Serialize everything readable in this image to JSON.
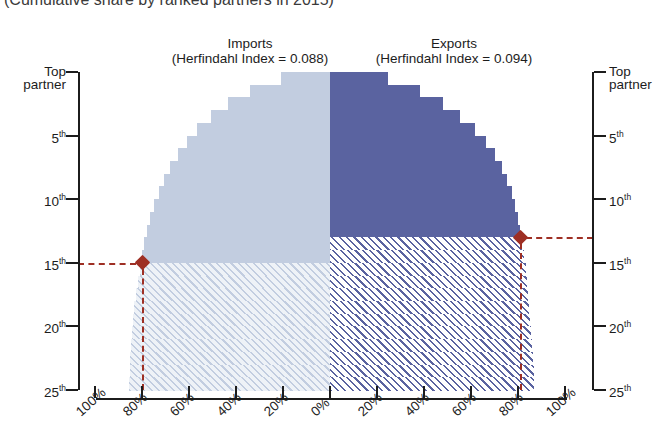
{
  "title": "(Cumulative share by ranked partners in 2015)",
  "panels": {
    "left": {
      "name": "Imports",
      "sub": "(Herfindahl Index = 0.088)"
    },
    "right": {
      "name": "Exports",
      "sub": "(Herfindahl Index = 0.094)"
    }
  },
  "axes": {
    "y_top_label_line1": "Top",
    "y_top_label_line2": "partner",
    "y_ticks": [
      "5",
      "10",
      "15",
      "20",
      "25"
    ],
    "y_suffix": "th",
    "x_left_labels": [
      "100%",
      "80%",
      "60%",
      "40%",
      "20%",
      "0%"
    ],
    "x_right_labels": [
      "20%",
      "40%",
      "60%",
      "80%",
      "100%"
    ]
  },
  "colors": {
    "imports_solid": "#c2cde0",
    "imports_hatch_bg": "#eef2f7",
    "imports_hatch_line": "#c2cde0",
    "exports_solid": "#5a63a0",
    "exports_hatch_bg": "#ffffff",
    "exports_hatch_line": "#5a63a0",
    "marker": "#9e2f24",
    "axis": "#1c1c1c"
  },
  "chart_data": {
    "type": "bar",
    "orientation": "butterfly-horizontal",
    "title": "(Cumulative share by ranked partners in 2015)",
    "xlabel": "",
    "ylabel": "Partner rank",
    "xlim": [
      -100,
      100
    ],
    "ylim": [
      1,
      25
    ],
    "grid": false,
    "legend": "none",
    "categories": [
      "1",
      "2",
      "3",
      "4",
      "5",
      "6",
      "7",
      "8",
      "9",
      "10",
      "11",
      "12",
      "13",
      "14",
      "15",
      "16",
      "17",
      "18",
      "19",
      "20",
      "21",
      "22",
      "23",
      "24",
      "25"
    ],
    "series": [
      {
        "name": "Imports",
        "herfindahl_index": 0.088,
        "side": "left",
        "highlight_rank": 15,
        "highlight_value": 80,
        "values": [
          21.0,
          34.0,
          43.5,
          50.5,
          56.5,
          61.0,
          64.8,
          68.0,
          70.6,
          72.9,
          74.8,
          76.5,
          77.8,
          79.0,
          80.0,
          81.0,
          81.8,
          82.6,
          83.2,
          83.8,
          84.2,
          84.6,
          85.0,
          85.3,
          85.6
        ]
      },
      {
        "name": "Exports",
        "herfindahl_index": 0.094,
        "side": "right",
        "highlight_rank": 13,
        "highlight_value": 81,
        "values": [
          24.5,
          38.5,
          48.0,
          55.5,
          61.5,
          66.3,
          70.0,
          73.0,
          75.5,
          77.3,
          78.9,
          80.1,
          81.0,
          81.9,
          82.6,
          83.2,
          83.8,
          84.3,
          84.8,
          85.2,
          85.6,
          86.0,
          86.3,
          86.6,
          86.9
        ]
      }
    ],
    "annotations": [
      {
        "name": "imports-80pct-at-15th",
        "value": 80,
        "rank": 15,
        "side": "left"
      },
      {
        "name": "exports-81pct-at-13th",
        "value": 81,
        "rank": 13,
        "side": "right"
      }
    ]
  }
}
